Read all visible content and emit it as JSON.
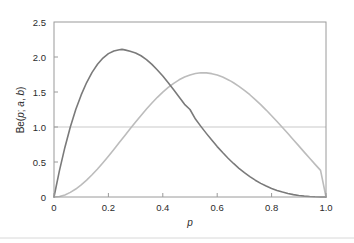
{
  "chart_data": {
    "type": "line",
    "title": "",
    "subtitle": "",
    "xlabel": "p",
    "ylabel": "Be(p; a, b)",
    "ylabel_parts": {
      "be": "Be",
      "open": "(",
      "p": "p",
      "semicolon": "; ",
      "a": "a",
      "comma": ", ",
      "b": "b",
      "close": ")"
    },
    "xlim": [
      0,
      1
    ],
    "ylim": [
      0,
      2.5
    ],
    "xticks": [
      0,
      0.2,
      0.4,
      0.6,
      0.8,
      1.0
    ],
    "xtick_labels": [
      "0",
      "0.2",
      "0.4",
      "0.6",
      "0.8",
      "1.0"
    ],
    "yticks": [
      0,
      0.5,
      1.0,
      1.5,
      2.0,
      2.5
    ],
    "ytick_labels": [
      "0",
      "0.5",
      "1.0",
      "1.5",
      "2.0",
      "2.5"
    ],
    "grid": false,
    "legend": null,
    "legend_position": "none",
    "reference_lines": [
      {
        "name": "uniform-reference-line",
        "orientation": "horizontal",
        "y": 1.0,
        "color": "#c9c9c9",
        "width": 1
      }
    ],
    "series": [
      {
        "name": "beta-curve-dark",
        "label": "Be(p; 2, 4)",
        "color": "#7a7a7a",
        "width": 1.6,
        "peak": {
          "x": 0.25,
          "y": 2.1
        },
        "x": [
          0.0,
          0.02,
          0.04,
          0.06,
          0.08,
          0.1,
          0.12,
          0.14,
          0.16,
          0.18,
          0.2,
          0.22,
          0.24,
          0.25,
          0.26,
          0.28,
          0.3,
          0.32,
          0.34,
          0.36,
          0.38,
          0.4,
          0.42,
          0.44,
          0.46,
          0.48,
          0.5,
          0.52,
          0.54,
          0.56,
          0.58,
          0.6,
          0.62,
          0.64,
          0.66,
          0.68,
          0.7,
          0.72,
          0.74,
          0.76,
          0.78,
          0.8,
          0.82,
          0.84,
          0.86,
          0.88,
          0.9,
          0.92,
          0.94,
          0.96,
          0.98,
          1.0
        ],
        "y": [
          0.0,
          0.376,
          0.708,
          0.999,
          1.25,
          1.458,
          1.635,
          1.78,
          1.896,
          1.985,
          2.048,
          2.087,
          2.104,
          2.109,
          2.102,
          2.081,
          2.058,
          2.018,
          1.963,
          1.894,
          1.814,
          1.728,
          1.633,
          1.533,
          1.43,
          1.324,
          1.25,
          1.113,
          1.009,
          0.909,
          0.813,
          0.72,
          0.635,
          0.554,
          0.479,
          0.41,
          0.348,
          0.291,
          0.24,
          0.195,
          0.156,
          0.123,
          0.094,
          0.07,
          0.05,
          0.034,
          0.022,
          0.013,
          0.007,
          0.003,
          0.001,
          0.0
        ]
      },
      {
        "name": "beta-curve-light",
        "label": "Be(p; 3, 2)",
        "color": "#bcbcbc",
        "width": 1.6,
        "peak": {
          "x": 0.65,
          "y": 1.77
        },
        "x": [
          0.0,
          0.02,
          0.04,
          0.06,
          0.08,
          0.1,
          0.12,
          0.14,
          0.16,
          0.18,
          0.2,
          0.22,
          0.24,
          0.26,
          0.28,
          0.3,
          0.32,
          0.34,
          0.36,
          0.38,
          0.4,
          0.42,
          0.44,
          0.46,
          0.48,
          0.5,
          0.52,
          0.54,
          0.56,
          0.58,
          0.6,
          0.62,
          0.64,
          0.65,
          0.66,
          0.68,
          0.7,
          0.72,
          0.74,
          0.76,
          0.78,
          0.8,
          0.82,
          0.84,
          0.86,
          0.88,
          0.9,
          0.92,
          0.94,
          0.96,
          0.98,
          1.0
        ],
        "y": [
          0.0,
          0.008,
          0.03,
          0.066,
          0.114,
          0.173,
          0.241,
          0.318,
          0.401,
          0.49,
          0.583,
          0.679,
          0.777,
          0.876,
          0.974,
          1.071,
          1.165,
          1.256,
          1.343,
          1.424,
          1.498,
          1.565,
          1.624,
          1.674,
          1.714,
          1.744,
          1.764,
          1.774,
          1.773,
          1.762,
          1.742,
          1.713,
          1.676,
          1.655,
          1.632,
          1.581,
          1.524,
          1.461,
          1.392,
          1.319,
          1.242,
          1.161,
          1.078,
          0.992,
          0.906,
          0.818,
          0.73,
          0.641,
          0.553,
          0.466,
          0.38,
          0.0
        ]
      }
    ]
  },
  "figure": {
    "background_color": "#ffffff",
    "frame_color": "#9a9a9a",
    "tick_color": "#9a9a9a",
    "text_color": "#2b2b2b",
    "footer_rule_color": "#d8d8d8"
  }
}
